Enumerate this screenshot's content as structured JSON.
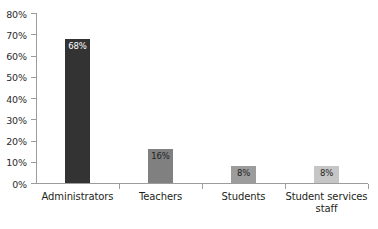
{
  "chart_data": {
    "type": "bar",
    "title": "",
    "subtitle": "",
    "xlabel": "",
    "ylabel": "",
    "categories": [
      "Administrators",
      "Teachers",
      "Students",
      "Student services staff"
    ],
    "values": [
      68,
      16,
      8,
      8
    ],
    "data_labels": [
      "68%",
      "16%",
      "8%",
      "8%"
    ],
    "ylim": [
      0,
      80
    ],
    "ytick_values": [
      0,
      10,
      20,
      30,
      40,
      50,
      60,
      70,
      80
    ],
    "ytick_labels": [
      "0%",
      "10%",
      "20%",
      "30%",
      "40%",
      "50%",
      "60%",
      "70%",
      "80%"
    ],
    "grid": false,
    "legend": false,
    "legend_position": "none",
    "bar_colors": [
      "#333333",
      "#808080",
      "#9c9c9c",
      "#c6c6c6"
    ],
    "label_colors": [
      "#ffffff",
      "#1e1e1e",
      "#1e1e1e",
      "#1e1e1e"
    ],
    "axis_color": "#9c9c9c",
    "background": "#ffffff"
  },
  "axis": {
    "y_ticks": [
      {
        "label": "80%",
        "value": 80
      },
      {
        "label": "70%",
        "value": 70
      },
      {
        "label": "60%",
        "value": 60
      },
      {
        "label": "50%",
        "value": 50
      },
      {
        "label": "40%",
        "value": 40
      },
      {
        "label": "30%",
        "value": 30
      },
      {
        "label": "20%",
        "value": 20
      },
      {
        "label": "10%",
        "value": 10
      },
      {
        "label": "0%",
        "value": 0
      }
    ]
  },
  "categories": [
    {
      "label": "Administrators",
      "value_label": "68%"
    },
    {
      "label": "Teachers",
      "value_label": "16%"
    },
    {
      "label": "Students",
      "value_label": "8%"
    },
    {
      "label": "Student services staff",
      "value_label": "8%"
    }
  ]
}
